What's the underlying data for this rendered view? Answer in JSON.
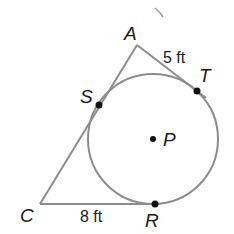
{
  "diagram": {
    "title": "",
    "points": {
      "A": {
        "label": "A",
        "x": 137,
        "y": 45
      },
      "T": {
        "label": "T",
        "x": 197,
        "y": 91
      },
      "S": {
        "label": "S",
        "x": 99,
        "y": 105
      },
      "C": {
        "label": "C",
        "x": 40,
        "y": 204
      },
      "R": {
        "label": "R",
        "x": 155,
        "y": 204
      },
      "P": {
        "label": "P",
        "x": 153,
        "y": 139
      }
    },
    "circle": {
      "center": "P",
      "radius": 65
    },
    "measurements": {
      "AT": "5 ft",
      "CR": "8 ft"
    },
    "colors": {
      "line": "#8c8c8c",
      "point": "#111111",
      "text": "#1a1a1a"
    }
  }
}
